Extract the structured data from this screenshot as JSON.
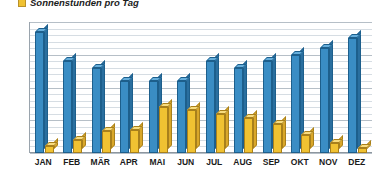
{
  "legend": {
    "swatch_color": "#f0c232",
    "label": "Sonnenstunden pro Tag"
  },
  "colors": {
    "series_blue": "#3a8dc4",
    "series_yellow": "#f0c232",
    "grid": "#d6dde3",
    "axis": "#8d969e",
    "text": "#1b1b1b"
  },
  "axis": {
    "y_ticks": [
      "20",
      "15",
      "10",
      "5",
      "0"
    ],
    "x_labels": [
      "JAN",
      "FEB",
      "MÄR",
      "APR",
      "MAI",
      "JUN",
      "JUL",
      "AUG",
      "SEP",
      "OKT",
      "NOV",
      "DEZ"
    ]
  },
  "chart_data": {
    "type": "bar",
    "title": "",
    "subtitle": "",
    "xlabel": "",
    "ylabel": "",
    "ylim": [
      0,
      20
    ],
    "y_ticks": [
      0,
      5,
      10,
      15,
      20
    ],
    "minor_tick_step": 1,
    "grid": true,
    "legend_position": "top-left",
    "style": "3d-column",
    "categories": [
      "JAN",
      "FEB",
      "MÄR",
      "APR",
      "MAI",
      "JUN",
      "JUL",
      "AUG",
      "SEP",
      "OKT",
      "NOV",
      "DEZ"
    ],
    "series": [
      {
        "name": "",
        "color": "#3a8dc4",
        "values": [
          18.5,
          14.0,
          13.0,
          11.0,
          11.0,
          11.0,
          14.0,
          13.0,
          14.0,
          15.0,
          16.0,
          17.5
        ]
      },
      {
        "name": "Sonnenstunden pro Tag",
        "color": "#f0c232",
        "values": [
          1.0,
          2.0,
          3.3,
          3.5,
          7.0,
          6.5,
          6.0,
          5.3,
          4.5,
          2.8,
          1.5,
          0.8
        ]
      }
    ]
  }
}
